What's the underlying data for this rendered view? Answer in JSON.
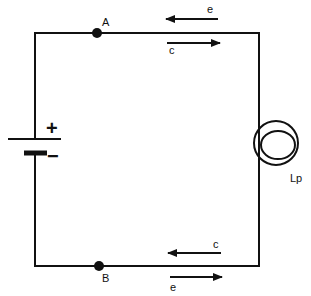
{
  "colors": {
    "ink": "#111111",
    "background": "#ffffff"
  },
  "nodes": {
    "a": {
      "label": "A"
    },
    "b": {
      "label": "B"
    }
  },
  "battery": {
    "positive_label": "+",
    "negative_label": "−"
  },
  "lamp": {
    "label": "Lp"
  },
  "arrows": {
    "top_electron": {
      "label": "e",
      "direction": "left"
    },
    "top_current": {
      "label": "c",
      "direction": "right"
    },
    "bottom_current": {
      "label": "c",
      "direction": "left"
    },
    "bottom_electron": {
      "label": "e",
      "direction": "right"
    }
  }
}
